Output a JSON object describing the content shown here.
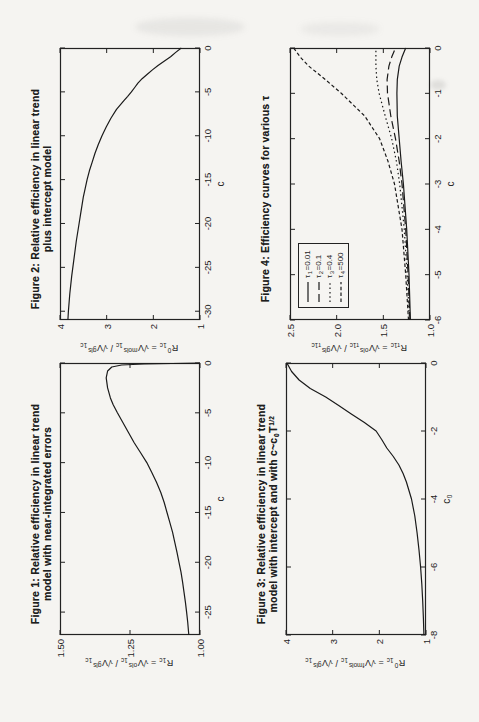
{
  "page": {
    "background": "#f5f4f1",
    "ink": "#1e1e1e"
  },
  "chart_data": [
    {
      "type": "line",
      "figure": "Figure 1",
      "title_line1": "Figure 1: Relative efficiency in linear trend",
      "title_line2_parts": [
        {
          "t": "model with near-integrated errors"
        }
      ],
      "xlabel_parts": [
        {
          "t": "c"
        }
      ],
      "ylabel_parts": [
        {
          "t": "R"
        },
        {
          "sub": "1c"
        },
        {
          "t": " = "
        },
        {
          "t": "√V"
        },
        {
          "sup": "ols"
        },
        {
          "sub": "1c"
        },
        {
          "t": " / "
        },
        {
          "t": "√V"
        },
        {
          "sup": "gls"
        },
        {
          "sub": "1c"
        }
      ],
      "xlim": [
        -27.3,
        0
      ],
      "ylim": [
        1.0,
        1.5
      ],
      "grid": false,
      "xticks": [
        {
          "v": 0,
          "label": "0"
        },
        {
          "v": -5,
          "label": "-5"
        },
        {
          "v": -10,
          "label": "-10"
        },
        {
          "v": -15,
          "label": "-15"
        },
        {
          "v": -20,
          "label": "-20"
        },
        {
          "v": -25,
          "label": "-25"
        }
      ],
      "yticks": [
        {
          "v": 1.5,
          "label": "1.50"
        },
        {
          "v": 1.25,
          "label": "1.25"
        },
        {
          "v": 1.0,
          "label": "1.00"
        }
      ],
      "series": [
        {
          "name": "R_1c (ols vs gls)",
          "dash": "solid",
          "points": [
            [
              0,
              1.0
            ],
            [
              -0.05,
              1.1
            ],
            [
              -0.1,
              1.2
            ],
            [
              -0.2,
              1.28
            ],
            [
              -0.4,
              1.315
            ],
            [
              -0.8,
              1.33
            ],
            [
              -1.5,
              1.335
            ],
            [
              -2.5,
              1.33
            ],
            [
              -3.5,
              1.32
            ],
            [
              -4.2,
              1.31
            ],
            [
              -5,
              1.295
            ],
            [
              -6,
              1.275
            ],
            [
              -7,
              1.255
            ],
            [
              -8,
              1.235
            ],
            [
              -9,
              1.212
            ],
            [
              -10,
              1.19
            ],
            [
              -11,
              1.172
            ],
            [
              -12,
              1.155
            ],
            [
              -13,
              1.14
            ],
            [
              -14,
              1.128
            ],
            [
              -15,
              1.118
            ],
            [
              -16,
              1.108
            ],
            [
              -17,
              1.098
            ],
            [
              -18,
              1.09
            ],
            [
              -19,
              1.082
            ],
            [
              -20,
              1.075
            ],
            [
              -21,
              1.068
            ],
            [
              -22,
              1.062
            ],
            [
              -23,
              1.057
            ],
            [
              -24,
              1.052
            ],
            [
              -25,
              1.048
            ],
            [
              -26,
              1.044
            ],
            [
              -27.3,
              1.04
            ]
          ]
        }
      ]
    },
    {
      "type": "line",
      "figure": "Figure 2",
      "title_line1": "Figure 2: Relative efficiency in linear trend",
      "title_line2_parts": [
        {
          "t": "plus intercept model"
        }
      ],
      "xlabel_parts": [
        {
          "t": "c"
        }
      ],
      "ylabel_parts": [
        {
          "t": "R"
        },
        {
          "sup": "0"
        },
        {
          "sub": "1c"
        },
        {
          "t": " = "
        },
        {
          "t": "√V"
        },
        {
          "sup": "mols"
        },
        {
          "sub": "1c"
        },
        {
          "t": " / "
        },
        {
          "t": "√V"
        },
        {
          "sup": "gls"
        },
        {
          "sub": "1c"
        }
      ],
      "xlim": [
        -31,
        0
      ],
      "ylim": [
        1,
        4
      ],
      "grid": false,
      "xticks": [
        {
          "v": 0,
          "label": "0"
        },
        {
          "v": -5,
          "label": "-5"
        },
        {
          "v": -10,
          "label": "-10"
        },
        {
          "v": -15,
          "label": "-15"
        },
        {
          "v": -20,
          "label": "-20"
        },
        {
          "v": -25,
          "label": "-25"
        },
        {
          "v": -30,
          "label": "-30"
        }
      ],
      "yticks": [
        {
          "v": 4,
          "label": "4"
        },
        {
          "v": 3,
          "label": "3"
        },
        {
          "v": 2,
          "label": "2"
        },
        {
          "v": 1,
          "label": "1"
        }
      ],
      "series": [
        {
          "name": "R0_1c (mols vs gls)",
          "dash": "solid",
          "points": [
            [
              0,
              1.4
            ],
            [
              -0.5,
              1.52
            ],
            [
              -1,
              1.63
            ],
            [
              -1.5,
              1.77
            ],
            [
              -2,
              1.9
            ],
            [
              -2.5,
              2.02
            ],
            [
              -3,
              2.13
            ],
            [
              -3.5,
              2.24
            ],
            [
              -4,
              2.33
            ],
            [
              -4.5,
              2.4
            ],
            [
              -5,
              2.47
            ],
            [
              -5.5,
              2.55
            ],
            [
              -6,
              2.63
            ],
            [
              -7,
              2.79
            ],
            [
              -8,
              2.91
            ],
            [
              -9,
              3.01
            ],
            [
              -10,
              3.1
            ],
            [
              -11,
              3.18
            ],
            [
              -12,
              3.25
            ],
            [
              -13,
              3.31
            ],
            [
              -14,
              3.37
            ],
            [
              -15,
              3.42
            ],
            [
              -16,
              3.46
            ],
            [
              -17,
              3.5
            ],
            [
              -18,
              3.53
            ],
            [
              -19,
              3.56
            ],
            [
              -20,
              3.59
            ],
            [
              -22,
              3.65
            ],
            [
              -24,
              3.7
            ],
            [
              -26,
              3.75
            ],
            [
              -28,
              3.79
            ],
            [
              -30,
              3.82
            ],
            [
              -31,
              3.83
            ]
          ]
        }
      ]
    },
    {
      "type": "line",
      "figure": "Figure 3",
      "title_line1": "Figure 3: Relative efficiency in linear trend",
      "title_line2_parts": [
        {
          "t": "model with intercept and with c~c"
        },
        {
          "sub": "0"
        },
        {
          "t": "T"
        },
        {
          "sup": "1/2"
        }
      ],
      "xlabel_parts": [
        {
          "t": "c"
        },
        {
          "sub": "0"
        }
      ],
      "ylabel_parts": [
        {
          "t": "R"
        },
        {
          "sup": "0"
        },
        {
          "sub": "1c"
        },
        {
          "t": " = "
        },
        {
          "t": "√V"
        },
        {
          "sup": "fmols"
        },
        {
          "sub": "1c"
        },
        {
          "t": " / "
        },
        {
          "t": "√V"
        },
        {
          "sup": "gls"
        },
        {
          "sub": "1c"
        }
      ],
      "xlim": [
        -8,
        0
      ],
      "ylim": [
        1,
        4
      ],
      "grid": false,
      "xticks": [
        {
          "v": 0,
          "label": "0"
        },
        {
          "v": -2,
          "label": "-2"
        },
        {
          "v": -4,
          "label": "-4"
        },
        {
          "v": -6,
          "label": "-6"
        },
        {
          "v": -8,
          "label": "-8"
        }
      ],
      "yticks": [
        {
          "v": 4,
          "label": "4"
        },
        {
          "v": 3,
          "label": "3"
        },
        {
          "v": 2,
          "label": "2"
        },
        {
          "v": 1,
          "label": "1"
        }
      ],
      "series": [
        {
          "name": "R0_1c (fmols vs gls)",
          "dash": "solid",
          "points": [
            [
              0,
              3.98
            ],
            [
              -0.25,
              3.88
            ],
            [
              -0.5,
              3.72
            ],
            [
              -0.75,
              3.48
            ],
            [
              -1,
              3.15
            ],
            [
              -1.25,
              2.87
            ],
            [
              -1.5,
              2.6
            ],
            [
              -1.75,
              2.32
            ],
            [
              -2,
              2.07
            ],
            [
              -2.25,
              1.95
            ],
            [
              -2.5,
              1.84
            ],
            [
              -2.75,
              1.7
            ],
            [
              -3,
              1.58
            ],
            [
              -3.25,
              1.49
            ],
            [
              -3.5,
              1.42
            ],
            [
              -4,
              1.31
            ],
            [
              -4.5,
              1.24
            ],
            [
              -5,
              1.19
            ],
            [
              -5.5,
              1.15
            ],
            [
              -6,
              1.115
            ],
            [
              -6.5,
              1.09
            ],
            [
              -7,
              1.07
            ],
            [
              -7.5,
              1.055
            ],
            [
              -8,
              1.045
            ]
          ]
        }
      ]
    },
    {
      "type": "line",
      "figure": "Figure 4",
      "title_line1": "Figure 4: Efficiency curves for various τ",
      "title_line2_parts": [],
      "xlabel_parts": [
        {
          "t": "c"
        }
      ],
      "ylabel_parts": [
        {
          "t": "R"
        },
        {
          "sub": "τ1c"
        },
        {
          "t": " = "
        },
        {
          "t": "√V"
        },
        {
          "sup": "ols"
        },
        {
          "sub": "τ1c"
        },
        {
          "t": " / "
        },
        {
          "t": "√V"
        },
        {
          "sup": "gls"
        },
        {
          "sub": "τ1c"
        }
      ],
      "xlim": [
        -6,
        0
      ],
      "ylim": [
        1.0,
        2.5
      ],
      "grid": false,
      "legend_position": "top-left",
      "xticks": [
        {
          "v": 0,
          "label": "0"
        },
        {
          "v": -1,
          "label": "-1"
        },
        {
          "v": -2,
          "label": "-2"
        },
        {
          "v": -3,
          "label": "-3"
        },
        {
          "v": -4,
          "label": "-4"
        },
        {
          "v": -5,
          "label": "-5"
        },
        {
          "v": -6,
          "label": "-6"
        }
      ],
      "yticks": [
        {
          "v": 2.5,
          "label": "2.5"
        },
        {
          "v": 2.0,
          "label": "2.0"
        },
        {
          "v": 1.5,
          "label": "1.5"
        },
        {
          "v": 1.0,
          "label": "1.0"
        }
      ],
      "legend": {
        "entries": [
          {
            "dash": "solid",
            "label_parts": [
              {
                "t": "τ"
              },
              {
                "sub": "1"
              },
              {
                "t": "=0.01"
              }
            ]
          },
          {
            "dash": "longdash",
            "label_parts": [
              {
                "t": "τ"
              },
              {
                "sub": "2"
              },
              {
                "t": "=0.1"
              }
            ]
          },
          {
            "dash": "dot",
            "label_parts": [
              {
                "t": "τ"
              },
              {
                "sub": "3"
              },
              {
                "t": "=0.4"
              }
            ]
          },
          {
            "dash": "shortdash",
            "label_parts": [
              {
                "t": "τ"
              },
              {
                "sub": "4"
              },
              {
                "t": "=500"
              }
            ]
          }
        ]
      },
      "series": [
        {
          "name": "tau1=0.01",
          "dash": "solid",
          "points": [
            [
              -6,
              1.21
            ],
            [
              -5,
              1.225
            ],
            [
              -4,
              1.25
            ],
            [
              -3,
              1.285
            ],
            [
              -2.5,
              1.31
            ],
            [
              -2,
              1.33
            ],
            [
              -1.5,
              1.35
            ],
            [
              -1,
              1.355
            ],
            [
              -0.7,
              1.35
            ],
            [
              -0.4,
              1.33
            ],
            [
              -0.2,
              1.3
            ],
            [
              0,
              1.26
            ]
          ]
        },
        {
          "name": "tau2=0.1",
          "dash": "longdash",
          "points": [
            [
              -6,
              1.215
            ],
            [
              -5,
              1.235
            ],
            [
              -4,
              1.26
            ],
            [
              -3,
              1.3
            ],
            [
              -2.5,
              1.33
            ],
            [
              -2,
              1.37
            ],
            [
              -1.5,
              1.42
            ],
            [
              -1,
              1.455
            ],
            [
              -0.7,
              1.46
            ],
            [
              -0.4,
              1.44
            ],
            [
              -0.2,
              1.41
            ],
            [
              0,
              1.37
            ]
          ]
        },
        {
          "name": "tau3=0.4",
          "dash": "dot",
          "points": [
            [
              -6,
              1.22
            ],
            [
              -5,
              1.245
            ],
            [
              -4,
              1.275
            ],
            [
              -3,
              1.325
            ],
            [
              -2.5,
              1.36
            ],
            [
              -2,
              1.41
            ],
            [
              -1.5,
              1.48
            ],
            [
              -1,
              1.545
            ],
            [
              -0.7,
              1.57
            ],
            [
              -0.4,
              1.58
            ],
            [
              0,
              1.58
            ]
          ]
        },
        {
          "name": "tau4=500",
          "dash": "shortdash",
          "points": [
            [
              -6,
              1.23
            ],
            [
              -5,
              1.26
            ],
            [
              -4,
              1.3
            ],
            [
              -3,
              1.38
            ],
            [
              -2.5,
              1.45
            ],
            [
              -2,
              1.54
            ],
            [
              -1.5,
              1.7
            ],
            [
              -1,
              1.95
            ],
            [
              -0.7,
              2.12
            ],
            [
              -0.4,
              2.3
            ],
            [
              -0.2,
              2.39
            ],
            [
              0,
              2.46
            ]
          ]
        }
      ]
    }
  ]
}
